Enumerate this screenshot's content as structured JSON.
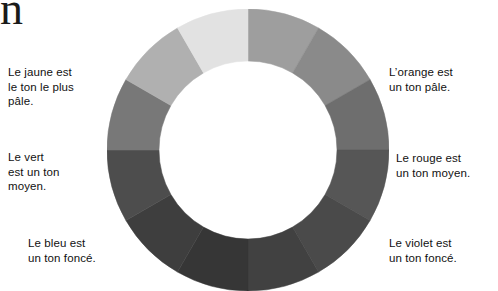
{
  "page": {
    "background_color": "#ffffff",
    "width": 498,
    "height": 291,
    "clipped_glyph": "n"
  },
  "captions": {
    "jaune": {
      "text": "Le jaune est\nle ton le plus\npâle."
    },
    "vert": {
      "text": "Le vert\nest un ton\nmoyen."
    },
    "bleu": {
      "text": "Le bleu est\nun ton foncé."
    },
    "orange": {
      "text": "L’orange est\nun ton pâle."
    },
    "rouge": {
      "text": "Le rouge est\nun ton moyen."
    },
    "violet": {
      "text": "Le violet est\nun ton foncé."
    }
  },
  "chart_data": {
    "type": "pie",
    "variant": "donut",
    "title": "",
    "subtitle": "",
    "xlabel": "",
    "ylabel": "",
    "legend_position": "outside-left-right",
    "grid": false,
    "center_x": 141,
    "center_y": 141,
    "outer_radius": 141,
    "inner_radius": 89,
    "segment_count": 12,
    "segment_angle_deg": 30,
    "start_angle_deg": 0,
    "categories": [
      "jaune-orangé",
      "orangé",
      "orange-rouge",
      "rouge",
      "rouge-violet",
      "violet",
      "bleu-violet",
      "bleu",
      "bleu-vert",
      "vert",
      "vert-jaune",
      "jaune"
    ],
    "values": [
      30,
      30,
      30,
      30,
      30,
      30,
      30,
      30,
      30,
      30,
      30,
      30
    ],
    "colors": [
      "#9e9e9e",
      "#8a8a8a",
      "#6e6e6e",
      "#565656",
      "#4a4a4a",
      "#414141",
      "#363636",
      "#3e3e3e",
      "#4d4d4d",
      "#787878",
      "#b0b0b0",
      "#e2e2e2"
    ],
    "segments": [
      {
        "name": "jaune-orangé",
        "start_deg": 0,
        "end_deg": 30,
        "color": "#9e9e9e",
        "tone": "pâle"
      },
      {
        "name": "orangé",
        "start_deg": 30,
        "end_deg": 60,
        "color": "#8a8a8a",
        "tone": "pâle"
      },
      {
        "name": "orange-rouge",
        "start_deg": 60,
        "end_deg": 90,
        "color": "#6e6e6e",
        "tone": "moyen"
      },
      {
        "name": "rouge",
        "start_deg": 90,
        "end_deg": 120,
        "color": "#565656",
        "tone": "moyen"
      },
      {
        "name": "rouge-violet",
        "start_deg": 120,
        "end_deg": 150,
        "color": "#4a4a4a",
        "tone": "foncé"
      },
      {
        "name": "violet",
        "start_deg": 150,
        "end_deg": 180,
        "color": "#414141",
        "tone": "foncé"
      },
      {
        "name": "bleu-violet",
        "start_deg": 180,
        "end_deg": 210,
        "color": "#363636",
        "tone": "foncé"
      },
      {
        "name": "bleu",
        "start_deg": 210,
        "end_deg": 240,
        "color": "#3e3e3e",
        "tone": "foncé"
      },
      {
        "name": "bleu-vert",
        "start_deg": 240,
        "end_deg": 270,
        "color": "#4d4d4d",
        "tone": "foncé"
      },
      {
        "name": "vert",
        "start_deg": 270,
        "end_deg": 300,
        "color": "#787878",
        "tone": "moyen"
      },
      {
        "name": "vert-jaune",
        "start_deg": 300,
        "end_deg": 330,
        "color": "#b0b0b0",
        "tone": "moyen"
      },
      {
        "name": "jaune",
        "start_deg": 330,
        "end_deg": 360,
        "color": "#e2e2e2",
        "tone": "le plus pâle"
      }
    ],
    "annotations": [
      {
        "target": "jaune",
        "side": "left",
        "text": "Le jaune est le ton le plus pâle."
      },
      {
        "target": "vert",
        "side": "left",
        "text": "Le vert est un ton moyen."
      },
      {
        "target": "bleu",
        "side": "left",
        "text": "Le bleu est un ton foncé."
      },
      {
        "target": "orangé",
        "side": "right",
        "text": "L’orange est un ton pâle."
      },
      {
        "target": "rouge",
        "side": "right",
        "text": "Le rouge est un ton moyen."
      },
      {
        "target": "violet",
        "side": "right",
        "text": "Le violet est un ton foncé."
      }
    ]
  }
}
